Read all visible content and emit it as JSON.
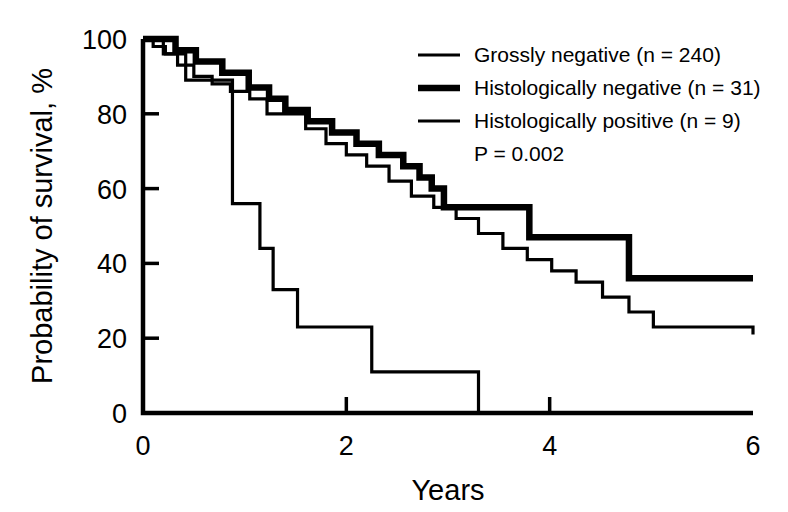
{
  "chart_data": {
    "type": "line",
    "subtype": "kaplan-meier-step",
    "title": "",
    "xlabel": "Years",
    "ylabel": "Probability of survival, %",
    "xlim": [
      0,
      6
    ],
    "ylim": [
      0,
      100
    ],
    "xticks": [
      0,
      2,
      4,
      6
    ],
    "xtick_labels": [
      "0",
      "2",
      "4",
      "6"
    ],
    "yticks": [
      0,
      20,
      40,
      60,
      80,
      100
    ],
    "ytick_labels": [
      "0",
      "20",
      "40",
      "60",
      "80",
      "100"
    ],
    "grid": false,
    "legend_position": "top-right",
    "annotations": [
      "P = 0.002"
    ],
    "series": [
      {
        "name": "Grossly negative",
        "label": "Grossly negative (n = 240)",
        "n": 240,
        "line_width": "thin",
        "color": "#000000",
        "x": [
          0.0,
          0.1,
          0.22,
          0.34,
          0.5,
          0.68,
          0.86,
          1.05,
          1.22,
          1.4,
          1.6,
          1.8,
          2.0,
          2.2,
          2.42,
          2.64,
          2.86,
          3.08,
          3.3,
          3.54,
          3.78,
          4.02,
          4.26,
          4.52,
          4.78,
          5.02,
          6.0
        ],
        "y": [
          100,
          98,
          96,
          93,
          90,
          88,
          86,
          84,
          80,
          80,
          76,
          72,
          69,
          66,
          62,
          58,
          55,
          52,
          48,
          44,
          41,
          38,
          35,
          31,
          27,
          23,
          21
        ]
      },
      {
        "name": "Histologically negative",
        "label": "Histologically negative (n = 31)",
        "n": 31,
        "line_width": "thick",
        "color": "#000000",
        "x": [
          0.0,
          0.32,
          0.52,
          0.78,
          1.04,
          1.24,
          1.4,
          1.62,
          1.86,
          2.1,
          2.32,
          2.56,
          2.72,
          2.84,
          2.96,
          3.8,
          4.78,
          6.0
        ],
        "y": [
          100,
          97,
          94,
          91,
          87,
          84,
          81,
          78,
          75,
          72,
          69,
          66,
          63,
          60,
          55,
          47,
          36,
          36
        ]
      },
      {
        "name": "Histologically positive",
        "label": "Histologically positive (n = 9)",
        "n": 9,
        "line_width": "thin",
        "color": "#000000",
        "x": [
          0.0,
          0.2,
          0.42,
          0.88,
          1.15,
          1.28,
          1.52,
          2.25,
          3.3
        ],
        "y": [
          100,
          96,
          89,
          56,
          44,
          33,
          23,
          11,
          0
        ]
      }
    ]
  },
  "axes": {
    "x_label": "Years",
    "y_label": "Probability of survival, %"
  },
  "legend": {
    "items": [
      {
        "label": "Grossly negative (n = 240)",
        "style": "thin"
      },
      {
        "label": "Histologically negative (n = 31)",
        "style": "thick"
      },
      {
        "label": "Histologically positive (n = 9)",
        "style": "thin"
      }
    ],
    "pvalue": "P = 0.002"
  }
}
